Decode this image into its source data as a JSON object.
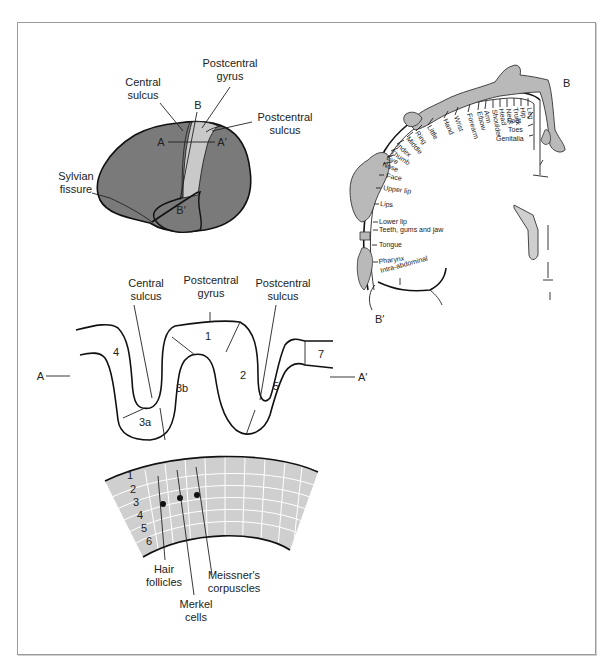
{
  "colors": {
    "brain_fill": "#7a7a7a",
    "gyrus_fill": "#c9c9c9",
    "homunculus_fill": "#b9b9b9",
    "skin_fill": "#cfcfcf",
    "frame_border": "#9a9a9a",
    "line": "#222222"
  },
  "brain_lateral": {
    "labels": {
      "central_sulcus_1": "Central",
      "central_sulcus_2": "sulcus",
      "postcentral_gyrus_1": "Postcentral",
      "postcentral_gyrus_2": "gyrus",
      "postcentral_sulcus_1": "Postcentral",
      "postcentral_sulcus_2": "sulcus",
      "sylvian_1": "Sylvian",
      "sylvian_2": "fissure",
      "A": "A",
      "A_prime": "A′",
      "B": "B",
      "B_prime": "B′"
    }
  },
  "homunculus": {
    "B": "B",
    "B_prime": "B′",
    "body_parts_top": [
      "Leg",
      "Hip",
      "Trunk",
      "Neck",
      "Head",
      "Shoulder",
      "Arm",
      "Elbow",
      "Forearm",
      "Wrist",
      "Hand",
      "Little",
      "Ring",
      "Middle",
      "Index",
      "Thumb",
      "Eye",
      "Nose"
    ],
    "body_parts_side": [
      "Face",
      "Upper lip",
      "Lips",
      "Lower lip",
      "Teeth, gums and jaw",
      "Tongue",
      "Pharynx",
      "Intra-abdominal"
    ],
    "body_parts_right": [
      "Foot",
      "Toes",
      "Genitalia"
    ]
  },
  "cross_section": {
    "labels": {
      "central_sulcus_1": "Central",
      "central_sulcus_2": "sulcus",
      "postcentral_gyrus_1": "Postcentral",
      "postcentral_gyrus_2": "gyrus",
      "postcentral_sulcus_1": "Postcentral",
      "postcentral_sulcus_2": "sulcus",
      "A": "A",
      "A_prime": "A′"
    },
    "areas": [
      "4",
      "3a",
      "3b",
      "1",
      "2",
      "5",
      "7"
    ]
  },
  "cortex_layers": {
    "layers": [
      "1",
      "2",
      "3",
      "4",
      "5",
      "6"
    ],
    "labels": {
      "hair_1": "Hair",
      "hair_2": "follicles",
      "merkel_1": "Merkel",
      "merkel_2": "cells",
      "meissner_1": "Meissner's",
      "meissner_2": "corpuscles"
    }
  }
}
